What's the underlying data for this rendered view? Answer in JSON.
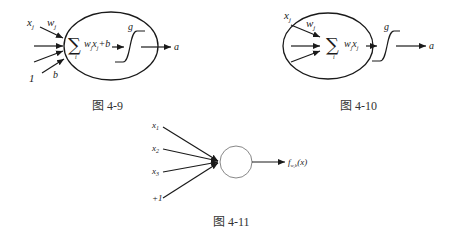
{
  "figures": [
    {
      "id": "fig-4-9",
      "caption": "图 4-9",
      "input_label": "x",
      "input_sub": "j",
      "weight_label": "w",
      "weight_sub": "j",
      "bias_input": "1",
      "bias_label": "b",
      "sum_symbol": "∑",
      "sum_index": "i",
      "expr_main": "w",
      "expr_sub1": "j",
      "expr_x": "x",
      "expr_sub2": "j",
      "expr_tail": "+b",
      "activation_label": "g",
      "output_label": "a"
    },
    {
      "id": "fig-4-10",
      "caption": "图 4-10",
      "input_label": "x",
      "input_sub": "j",
      "weight_label": "w",
      "weight_sub": "j",
      "sum_symbol": "∑",
      "sum_index": "i",
      "expr_main": "w",
      "expr_sub1": "j",
      "expr_x": "x",
      "expr_sub2": "j",
      "activation_label": "g",
      "output_label": "a"
    },
    {
      "id": "fig-4-11",
      "caption": "图 4-11",
      "inputs": [
        {
          "label": "x",
          "sub": "1"
        },
        {
          "label": "x",
          "sub": "2"
        },
        {
          "label": "x",
          "sub": "3"
        },
        {
          "label": "+1",
          "sub": ""
        }
      ],
      "output_f": "f",
      "output_sub": "w,b",
      "output_arg": "(x)"
    }
  ],
  "colors": {
    "stroke": "#1a1a1a",
    "circle_stroke": "#888888"
  }
}
